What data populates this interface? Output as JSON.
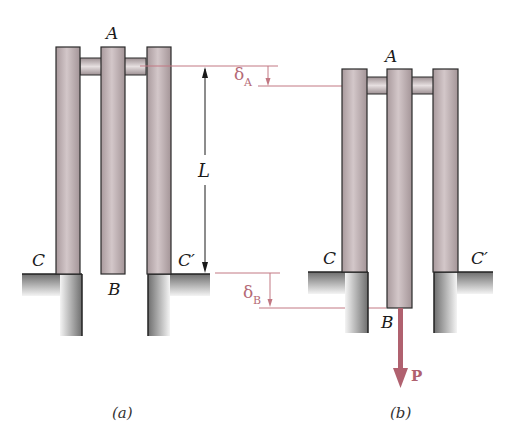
{
  "figure": {
    "colors": {
      "bar_fill": "#b7a9ac",
      "bar_highlight": "#dcd1d3",
      "bar_outline": "#2a2a2a",
      "ground_dark": "#7c7c7c",
      "ground_light": "#f2f2f2",
      "dimension_red": "#c27883",
      "force_red": "#b0616f",
      "dimension_black": "#1a1a1a"
    },
    "panel_a": {
      "caption": "(a)",
      "labels": {
        "top": "A",
        "bottom": "B",
        "left_support": "C",
        "right_support": "C′"
      },
      "dimension": {
        "label": "L"
      }
    },
    "panel_b": {
      "caption": "(b)",
      "labels": {
        "top": "A",
        "bottom": "B",
        "left_support": "C",
        "right_support": "C′"
      },
      "force": {
        "label": "P"
      }
    },
    "displacements": {
      "delta_a": {
        "symbol": "δ",
        "subscript": "A"
      },
      "delta_b": {
        "symbol": "δ",
        "subscript": "B"
      }
    }
  }
}
